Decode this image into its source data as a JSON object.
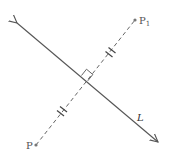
{
  "diagram": {
    "type": "geometry-reflection",
    "line": {
      "label": "L",
      "from": [
        17,
        23
      ],
      "to": [
        158,
        142
      ],
      "style": "solid",
      "arrows": "both",
      "color": "#555555"
    },
    "segment": {
      "from_label": "P",
      "to_label": "P",
      "to_subscript": "1",
      "from": [
        36,
        145
      ],
      "to": [
        135,
        20
      ],
      "style": "dashed",
      "color": "#555555"
    },
    "points": [
      {
        "name": "P",
        "label": "P",
        "x": 36,
        "y": 145
      },
      {
        "name": "P1",
        "label": "P",
        "subscript": "1",
        "x": 135,
        "y": 20
      }
    ],
    "markers": {
      "right_angle_at": [
        86,
        80
      ],
      "equal_length_ticks": [
        {
          "x": 111,
          "y": 52,
          "count": 2
        },
        {
          "x": 62,
          "y": 112,
          "count": 2
        }
      ]
    },
    "labels": {
      "P": "P",
      "P1_main": "P",
      "P1_sub": "1",
      "L": "L"
    }
  }
}
